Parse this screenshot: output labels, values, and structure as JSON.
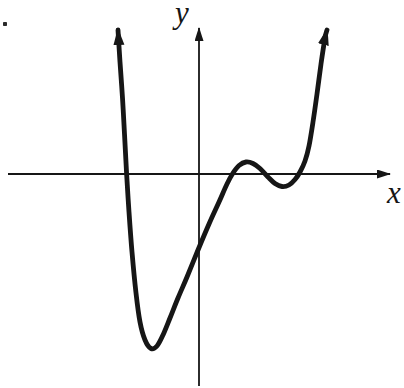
{
  "page": {
    "background": "#ffffff",
    "ink_color": "#161616",
    "stray_period": "."
  },
  "chart_data": {
    "type": "line",
    "title": "",
    "xlabel": "x",
    "ylabel": "y",
    "grid": false,
    "legend": "none",
    "tick_labels": "none (unscaled sketch axes with arrowheads)",
    "features": {
      "x_intercepts_px": [
        126.6,
        232.5,
        264.5,
        298.7
      ],
      "y_intercept_px": {
        "x": 199,
        "y": 250
      },
      "local_minimum_deep_px": {
        "x": 151,
        "y": 348.5
      },
      "local_maximum_px": {
        "x": 246,
        "y": 162
      },
      "local_minimum_shallow_px": {
        "x": 282,
        "y": 186.5
      },
      "curve_end_arrows": "both ends point upward"
    },
    "axes_px": {
      "origin": {
        "x": 199,
        "y": 174
      },
      "x_axis": {
        "x1": 8,
        "y1": 174,
        "x2": 390,
        "y2": 174
      },
      "y_axis": {
        "x1": 199,
        "y1": 386,
        "x2": 199,
        "y2": 28
      }
    },
    "curve_points_px": [
      [
        118,
        30
      ],
      [
        120,
        62
      ],
      [
        122.5,
        98
      ],
      [
        124.5,
        134
      ],
      [
        126.5,
        172
      ],
      [
        129,
        212
      ],
      [
        132,
        252
      ],
      [
        136,
        293
      ],
      [
        140,
        322
      ],
      [
        145,
        340
      ],
      [
        151,
        348.5
      ],
      [
        157,
        346
      ],
      [
        163,
        335
      ],
      [
        170,
        318
      ],
      [
        178,
        298
      ],
      [
        187,
        277
      ],
      [
        198,
        250
      ],
      [
        209,
        224
      ],
      [
        219,
        202
      ],
      [
        227,
        184
      ],
      [
        233,
        173
      ],
      [
        239,
        165.5
      ],
      [
        246,
        162
      ],
      [
        253,
        163.5
      ],
      [
        260,
        168.5
      ],
      [
        268,
        177
      ],
      [
        275,
        183.5
      ],
      [
        282,
        186.5
      ],
      [
        289,
        185
      ],
      [
        295,
        179.5
      ],
      [
        300,
        172
      ],
      [
        305,
        161
      ],
      [
        309,
        146
      ],
      [
        313,
        122
      ],
      [
        317,
        94
      ],
      [
        321,
        64
      ],
      [
        325,
        38
      ],
      [
        327,
        30
      ]
    ],
    "stray_dot_px": {
      "x": 5,
      "y": 24
    }
  }
}
